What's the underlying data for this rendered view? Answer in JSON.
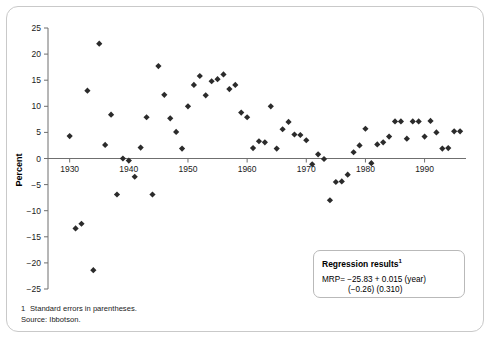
{
  "chart_data": {
    "type": "scatter",
    "title": "",
    "xlabel": "",
    "ylabel": "Percent",
    "xlim": [
      1926,
      1997
    ],
    "ylim": [
      -25,
      25
    ],
    "grid": false,
    "legend": null,
    "x_ticks": [
      1930,
      1940,
      1950,
      1960,
      1970,
      1980,
      1990
    ],
    "y_ticks": [
      25,
      20,
      15,
      10,
      5,
      0,
      -5,
      -10,
      -15,
      -20,
      -25
    ],
    "series": [
      {
        "name": "Market risk premium",
        "marker": "diamond",
        "color": "#2b2b2b",
        "points": [
          [
            1930,
            4.3
          ],
          [
            1931,
            -13.4
          ],
          [
            1932,
            -12.5
          ],
          [
            1933,
            13.0
          ],
          [
            1934,
            -21.4
          ],
          [
            1935,
            22.0
          ],
          [
            1936,
            2.6
          ],
          [
            1937,
            8.4
          ],
          [
            1938,
            -6.9
          ],
          [
            1939,
            0.0
          ],
          [
            1940,
            -0.4
          ],
          [
            1941,
            -3.5
          ],
          [
            1942,
            2.1
          ],
          [
            1943,
            7.9
          ],
          [
            1944,
            -6.9
          ],
          [
            1945,
            17.7
          ],
          [
            1946,
            12.2
          ],
          [
            1947,
            7.7
          ],
          [
            1948,
            5.1
          ],
          [
            1949,
            1.9
          ],
          [
            1950,
            10.0
          ],
          [
            1951,
            14.1
          ],
          [
            1952,
            15.8
          ],
          [
            1953,
            12.1
          ],
          [
            1954,
            14.8
          ],
          [
            1955,
            15.2
          ],
          [
            1956,
            16.1
          ],
          [
            1957,
            13.3
          ],
          [
            1958,
            14.1
          ],
          [
            1959,
            8.8
          ],
          [
            1960,
            7.9
          ],
          [
            1961,
            2.0
          ],
          [
            1962,
            3.3
          ],
          [
            1963,
            3.1
          ],
          [
            1964,
            10.0
          ],
          [
            1965,
            1.9
          ],
          [
            1966,
            5.6
          ],
          [
            1967,
            7.0
          ],
          [
            1968,
            4.6
          ],
          [
            1969,
            4.5
          ],
          [
            1970,
            3.5
          ],
          [
            1971,
            -1.1
          ],
          [
            1972,
            0.8
          ],
          [
            1973,
            -0.1
          ],
          [
            1974,
            -8.0
          ],
          [
            1975,
            -4.5
          ],
          [
            1976,
            -4.4
          ],
          [
            1977,
            -3.1
          ],
          [
            1978,
            1.2
          ],
          [
            1979,
            2.5
          ],
          [
            1980,
            5.7
          ],
          [
            1981,
            -0.9
          ],
          [
            1982,
            2.7
          ],
          [
            1983,
            3.1
          ],
          [
            1984,
            4.2
          ],
          [
            1985,
            7.1
          ],
          [
            1986,
            7.1
          ],
          [
            1987,
            3.8
          ],
          [
            1988,
            7.1
          ],
          [
            1989,
            7.1
          ],
          [
            1990,
            4.2
          ],
          [
            1991,
            7.2
          ],
          [
            1992,
            5.0
          ],
          [
            1993,
            1.9
          ],
          [
            1994,
            2.0
          ],
          [
            1995,
            5.2
          ],
          [
            1996,
            5.2
          ]
        ]
      }
    ]
  },
  "axes": {
    "y_title": "Percent",
    "x_tick_labels": [
      "1930",
      "1940",
      "1950",
      "1960",
      "1970",
      "1980",
      "1990"
    ],
    "y_tick_labels": [
      "25",
      "20",
      "15",
      "10",
      "5",
      "0",
      "−5",
      "−10",
      "−15",
      "−20",
      "−25"
    ]
  },
  "regression_box": {
    "title": "Regression results",
    "title_superscript": "1",
    "equation": "MRP= −25.83 + 0.015 (year)",
    "standard_errors": "(−0.26)   (0.310)"
  },
  "footnotes": {
    "marker": "1",
    "note": "Standard errors in parentheses.",
    "source": "Source: Ibbotson."
  },
  "colors": {
    "marker": "#2b2b2b",
    "axis": "#6f6f6f",
    "frame": "#c9c9c9",
    "box_border": "#b9b9b9"
  }
}
